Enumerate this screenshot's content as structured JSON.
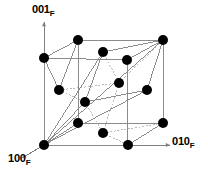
{
  "figure": {
    "type": "crystal-lattice-diagram",
    "background_color": "#ffffff",
    "atom_color": "#000000",
    "solid_line_color": "#808080",
    "dashed_line_color": "#b4b4b4",
    "axis_color": "#808080",
    "atom_radius": 5.0
  },
  "axes": [
    {
      "id": "axis-001",
      "index": "001",
      "subscript": "F",
      "direction": "up",
      "arrow_from": [
        44,
        60
      ],
      "arrow_to": [
        44,
        22
      ]
    },
    {
      "id": "axis-100",
      "index": "100",
      "subscript": "F",
      "direction": "down-left",
      "arrow_from": [
        44,
        145
      ],
      "arrow_to": [
        22,
        158
      ]
    },
    {
      "id": "axis-010",
      "index": "010",
      "subscript": "F",
      "direction": "right",
      "arrow_from": [
        128,
        145
      ],
      "arrow_to": [
        170,
        145
      ]
    }
  ],
  "atoms": [
    {
      "id": "atom-01",
      "x": 78,
      "y": 40,
      "site": "top-front-left-edge"
    },
    {
      "id": "atom-02",
      "x": 163,
      "y": 40,
      "site": "top-back-right-corner"
    },
    {
      "id": "atom-03",
      "x": 44,
      "y": 58,
      "site": "top-left-corner"
    },
    {
      "id": "atom-04",
      "x": 103,
      "y": 52,
      "site": "top-face-center"
    },
    {
      "id": "atom-05",
      "x": 127,
      "y": 60,
      "site": "top-right-edge"
    },
    {
      "id": "atom-06",
      "x": 59,
      "y": 90,
      "site": "left-face-center"
    },
    {
      "id": "atom-07",
      "x": 119,
      "y": 83,
      "site": "body-interior-upper"
    },
    {
      "id": "atom-08",
      "x": 85,
      "y": 102,
      "site": "body-center"
    },
    {
      "id": "atom-09",
      "x": 147,
      "y": 90,
      "site": "right-face-center"
    },
    {
      "id": "atom-10",
      "x": 78,
      "y": 123,
      "site": "bottom-front-left-edge"
    },
    {
      "id": "atom-11",
      "x": 103,
      "y": 133,
      "site": "bottom-face-center"
    },
    {
      "id": "atom-12",
      "x": 163,
      "y": 123,
      "site": "bottom-back-right-corner"
    },
    {
      "id": "atom-13",
      "x": 44,
      "y": 145,
      "site": "origin-corner"
    },
    {
      "id": "atom-14",
      "x": 128,
      "y": 145,
      "site": "bottom-front-right-corner"
    }
  ],
  "solid_edges": [
    {
      "from": [
        44,
        58
      ],
      "to": [
        78,
        40
      ]
    },
    {
      "from": [
        78,
        40
      ],
      "to": [
        163,
        40
      ]
    },
    {
      "from": [
        44,
        58
      ],
      "to": [
        127,
        60
      ]
    },
    {
      "from": [
        127,
        60
      ],
      "to": [
        163,
        40
      ]
    },
    {
      "from": [
        44,
        58
      ],
      "to": [
        44,
        145
      ]
    },
    {
      "from": [
        163,
        40
      ],
      "to": [
        163,
        123
      ]
    },
    {
      "from": [
        127,
        60
      ],
      "to": [
        127,
        145
      ]
    },
    {
      "from": [
        78,
        40
      ],
      "to": [
        78,
        123
      ]
    },
    {
      "from": [
        44,
        145
      ],
      "to": [
        128,
        145
      ]
    },
    {
      "from": [
        128,
        145
      ],
      "to": [
        163,
        123
      ]
    },
    {
      "from": [
        44,
        145
      ],
      "to": [
        78,
        123
      ]
    },
    {
      "from": [
        78,
        123
      ],
      "to": [
        163,
        123
      ]
    },
    {
      "from": [
        44,
        145
      ],
      "to": [
        103,
        52
      ]
    },
    {
      "from": [
        103,
        52
      ],
      "to": [
        163,
        40
      ]
    },
    {
      "from": [
        44,
        145
      ],
      "to": [
        85,
        102
      ]
    },
    {
      "from": [
        85,
        102
      ],
      "to": [
        103,
        52
      ]
    },
    {
      "from": [
        85,
        102
      ],
      "to": [
        147,
        90
      ]
    },
    {
      "from": [
        147,
        90
      ],
      "to": [
        163,
        40
      ]
    },
    {
      "from": [
        44,
        145
      ],
      "to": [
        147,
        90
      ]
    },
    {
      "from": [
        44,
        145
      ],
      "to": [
        163,
        40
      ]
    },
    {
      "from": [
        59,
        90
      ],
      "to": [
        44,
        58
      ]
    },
    {
      "from": [
        59,
        90
      ],
      "to": [
        78,
        40
      ]
    }
  ],
  "dashed_edges": [
    {
      "from": [
        59,
        90
      ],
      "to": [
        119,
        83
      ]
    },
    {
      "from": [
        119,
        83
      ],
      "to": [
        163,
        40
      ]
    },
    {
      "from": [
        59,
        90
      ],
      "to": [
        85,
        102
      ]
    },
    {
      "from": [
        119,
        83
      ],
      "to": [
        103,
        133
      ]
    },
    {
      "from": [
        103,
        133
      ],
      "to": [
        163,
        123
      ]
    },
    {
      "from": [
        85,
        102
      ],
      "to": [
        103,
        133
      ]
    },
    {
      "from": [
        103,
        133
      ],
      "to": [
        128,
        145
      ]
    },
    {
      "from": [
        103,
        52
      ],
      "to": [
        119,
        83
      ]
    }
  ],
  "chart_data": {
    "type": "scatter",
    "title": "",
    "xlabel": "010",
    "ylabel": "001",
    "zlabel": "100",
    "legend": [],
    "annotations": [
      "001 F",
      "100 F",
      "010 F"
    ]
  }
}
